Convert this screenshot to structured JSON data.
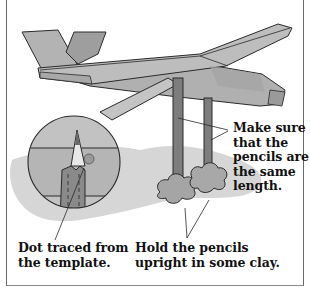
{
  "figure": {
    "colors": {
      "glider_fill": "#b3b3b3",
      "glider_shade": "#9a9a9a",
      "pencil_fill": "#7d7d7d",
      "clay_fill": "#a5a5a5",
      "shadow_fill": "#d6d6d6",
      "outline": "#2a2a2a",
      "frame": "#6a6a6a"
    },
    "inset": {
      "description": "magnified circle showing pencil tip and traced dot"
    }
  },
  "labels": {
    "same_length": "Make sure\nthat the\npencils are\nthe same\nlength.",
    "dot_traced": "Dot traced from\nthe template.",
    "hold_pencils": "Hold the pencils\nupright in some clay."
  }
}
